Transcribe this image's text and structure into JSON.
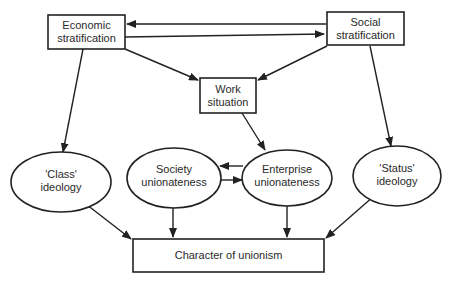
{
  "diagram": {
    "nodes": {
      "economic": {
        "line1": "Economic",
        "line2": "stratification",
        "shape": "rect"
      },
      "social": {
        "line1": "Social",
        "line2": "stratification",
        "shape": "rect"
      },
      "work": {
        "line1": "Work",
        "line2": "situation",
        "shape": "rect"
      },
      "class_ideology": {
        "line1": "'Class'",
        "line2": "ideology",
        "shape": "ellipse"
      },
      "society_unionateness": {
        "line1": "Society",
        "line2": "unionateness",
        "shape": "ellipse"
      },
      "enterprise_unionateness": {
        "line1": "Enterprise",
        "line2": "unionateness",
        "shape": "ellipse"
      },
      "status_ideology": {
        "line1": "'Status'",
        "line2": "ideology",
        "shape": "ellipse"
      },
      "character": {
        "line1": "Character of unionism",
        "shape": "rect"
      }
    },
    "edges": [
      {
        "from": "Social stratification",
        "to": "Economic stratification"
      },
      {
        "from": "Economic stratification",
        "to": "Social stratification"
      },
      {
        "from": "Economic stratification",
        "to": "Work situation"
      },
      {
        "from": "Social stratification",
        "to": "Work situation"
      },
      {
        "from": "Economic stratification",
        "to": "'Class' ideology"
      },
      {
        "from": "Social stratification",
        "to": "'Status' ideology"
      },
      {
        "from": "Work situation",
        "to": "Enterprise unionateness"
      },
      {
        "from": "Enterprise unionateness",
        "to": "Society unionateness"
      },
      {
        "from": "Society unionateness",
        "to": "Enterprise unionateness"
      },
      {
        "from": "'Class' ideology",
        "to": "Character of unionism"
      },
      {
        "from": "Society unionateness",
        "to": "Character of unionism"
      },
      {
        "from": "Enterprise unionateness",
        "to": "Character of unionism"
      },
      {
        "from": "'Status' ideology",
        "to": "Character of unionism"
      }
    ]
  }
}
